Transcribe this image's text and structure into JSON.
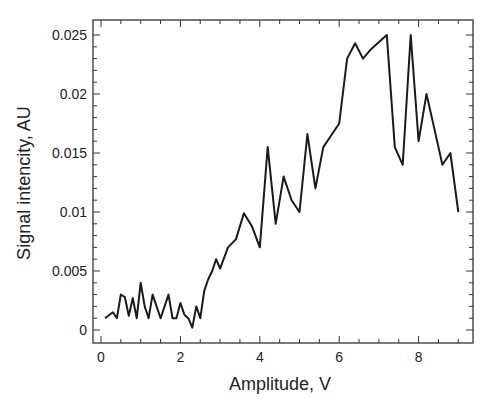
{
  "chart_data": {
    "type": "line",
    "title": "",
    "xlabel": "Amplitude, V",
    "ylabel": "Signal intencity, AU",
    "xlim": [
      -0.2,
      9.3
    ],
    "ylim": [
      -0.0011,
      0.0264
    ],
    "xticks": [
      0,
      2,
      4,
      6,
      8
    ],
    "xtick_labels": [
      "0",
      "2",
      "4",
      "6",
      "8"
    ],
    "yticks": [
      0,
      0.005,
      0.01,
      0.015,
      0.02,
      0.025
    ],
    "ytick_labels": [
      "0",
      "0.005",
      "0.01",
      "0.015",
      "0.02",
      "0.025"
    ],
    "grid": false,
    "legend": null,
    "series": [
      {
        "name": "Signal intencity",
        "color": "#1a1a1a",
        "x": [
          0.1,
          0.3,
          0.4,
          0.5,
          0.6,
          0.7,
          0.8,
          0.9,
          1.0,
          1.1,
          1.2,
          1.3,
          1.5,
          1.7,
          1.8,
          1.9,
          2.0,
          2.1,
          2.2,
          2.3,
          2.4,
          2.5,
          2.6,
          2.7,
          2.8,
          2.9,
          3.0,
          3.2,
          3.4,
          3.6,
          3.8,
          4.0,
          4.2,
          4.4,
          4.6,
          4.8,
          5.0,
          5.2,
          5.4,
          5.6,
          5.8,
          6.0,
          6.2,
          6.4,
          6.6,
          6.8,
          7.2,
          7.4,
          7.6,
          7.8,
          8.0,
          8.2,
          8.4,
          8.6,
          8.8,
          9.0
        ],
        "y": [
          0.001,
          0.0015,
          0.001,
          0.003,
          0.0028,
          0.0012,
          0.0027,
          0.001,
          0.004,
          0.002,
          0.001,
          0.003,
          0.001,
          0.003,
          0.001,
          0.001,
          0.0023,
          0.0013,
          0.001,
          0.0002,
          0.002,
          0.001,
          0.0033,
          0.0043,
          0.005,
          0.006,
          0.0052,
          0.007,
          0.0077,
          0.0099,
          0.0088,
          0.007,
          0.0155,
          0.009,
          0.013,
          0.011,
          0.01,
          0.0166,
          0.012,
          0.0155,
          0.0165,
          0.0175,
          0.023,
          0.0243,
          0.023,
          0.0238,
          0.025,
          0.0155,
          0.014,
          0.025,
          0.016,
          0.02,
          0.017,
          0.014,
          0.015,
          0.01
        ]
      }
    ]
  }
}
